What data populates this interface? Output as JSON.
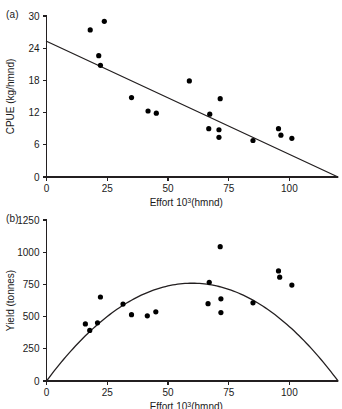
{
  "figure": {
    "panels": [
      {
        "id": "a",
        "label": "(a)"
      },
      {
        "id": "b",
        "label": "(b)"
      }
    ]
  },
  "chart_data": [
    {
      "type": "scatter",
      "panel": "(a)",
      "title": "",
      "xlabel": "Effort 10³(hmnd)",
      "xlabel_base": "Effort 10",
      "xlabel_exponent": "3",
      "xlabel_suffix": "(hmnd)",
      "ylabel": "CPUE (kg/hmnd)",
      "xlim": [
        0,
        120
      ],
      "ylim": [
        0,
        30
      ],
      "xticks": [
        0,
        25,
        50,
        75,
        100
      ],
      "yticks": [
        0,
        6,
        12,
        18,
        24,
        30
      ],
      "xticklabels": [
        "0",
        "25",
        "50",
        "75",
        "100"
      ],
      "yticklabels": [
        "0",
        "6",
        "12",
        "18",
        "24",
        "30"
      ],
      "grid": false,
      "legend": "none",
      "marker": "filled-circle",
      "marker_color": "#000000",
      "line_color": "#231f20",
      "points": [
        {
          "x": 18.0,
          "y": 27.4
        },
        {
          "x": 23.8,
          "y": 29.0
        },
        {
          "x": 21.5,
          "y": 22.6
        },
        {
          "x": 22.2,
          "y": 20.8
        },
        {
          "x": 35.0,
          "y": 14.8
        },
        {
          "x": 41.8,
          "y": 12.3
        },
        {
          "x": 45.2,
          "y": 11.9
        },
        {
          "x": 58.8,
          "y": 17.9
        },
        {
          "x": 67.2,
          "y": 11.7
        },
        {
          "x": 66.8,
          "y": 9.0
        },
        {
          "x": 71.0,
          "y": 8.8
        },
        {
          "x": 71.0,
          "y": 7.4
        },
        {
          "x": 71.5,
          "y": 14.6
        },
        {
          "x": 85.0,
          "y": 6.8
        },
        {
          "x": 95.5,
          "y": 9.0
        },
        {
          "x": 96.5,
          "y": 7.8
        },
        {
          "x": 101.0,
          "y": 7.2
        }
      ],
      "fit": {
        "type": "linear",
        "intercept": 25.3,
        "slope": -0.2108,
        "x_start": 0,
        "x_end": 120
      }
    },
    {
      "type": "scatter",
      "panel": "(b)",
      "title": "",
      "xlabel": "Effort 10³(hmnd)",
      "xlabel_base": "Effort 10",
      "xlabel_exponent": "3",
      "xlabel_suffix": "(hmnd)",
      "ylabel": "Yield (tonnes)",
      "xlim": [
        0,
        120
      ],
      "ylim": [
        0,
        1250
      ],
      "xticks": [
        0,
        25,
        50,
        75,
        100
      ],
      "yticks": [
        0,
        250,
        500,
        750,
        1000,
        1250
      ],
      "xticklabels": [
        "0",
        "25",
        "50",
        "75",
        "100"
      ],
      "yticklabels": [
        "0",
        "250",
        "500",
        "750",
        "1000",
        "1250"
      ],
      "grid": false,
      "legend": "none",
      "marker": "filled-circle",
      "marker_color": "#000000",
      "line_color": "#231f20",
      "points": [
        {
          "x": 16.0,
          "y": 443
        },
        {
          "x": 17.8,
          "y": 393
        },
        {
          "x": 21.0,
          "y": 452
        },
        {
          "x": 22.2,
          "y": 652
        },
        {
          "x": 31.5,
          "y": 597
        },
        {
          "x": 35.0,
          "y": 515
        },
        {
          "x": 41.5,
          "y": 506
        },
        {
          "x": 45.0,
          "y": 537
        },
        {
          "x": 66.5,
          "y": 600
        },
        {
          "x": 67.0,
          "y": 766
        },
        {
          "x": 71.5,
          "y": 1043
        },
        {
          "x": 71.8,
          "y": 638
        },
        {
          "x": 71.8,
          "y": 531
        },
        {
          "x": 85.0,
          "y": 607
        },
        {
          "x": 95.5,
          "y": 855
        },
        {
          "x": 96.0,
          "y": 806
        },
        {
          "x": 101.0,
          "y": 745
        }
      ],
      "fit": {
        "type": "parabola",
        "a": -0.2108,
        "b": 25.3,
        "x_start": 0,
        "x_end": 120,
        "vertex_x": 60,
        "vertex_y": 810
      }
    }
  ]
}
